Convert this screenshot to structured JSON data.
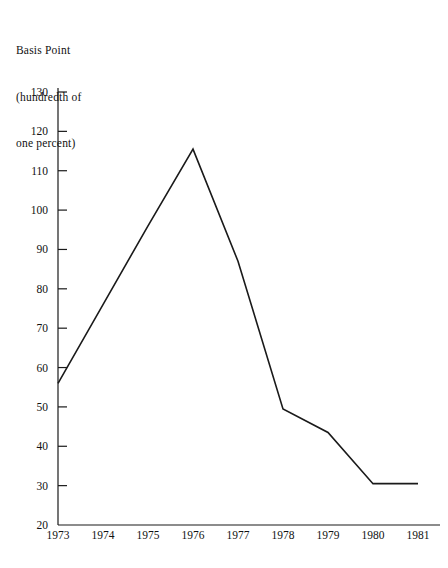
{
  "chart_data": {
    "type": "line",
    "title": "",
    "axis_title_lines": [
      "Basis Point",
      "(hundredth of",
      "one percent)"
    ],
    "ylabel": "Basis Point (hundredth of one percent)",
    "xlabel": "",
    "x": [
      "1973",
      "1974",
      "1975",
      "1976",
      "1977",
      "1978",
      "1979",
      "1980",
      "1981"
    ],
    "categories": [
      "1973",
      "1974",
      "1975",
      "1976",
      "1977",
      "1978",
      "1979",
      "1980",
      "1981"
    ],
    "values": [
      56,
      76,
      96,
      115.5,
      87,
      49.5,
      43.5,
      30.5,
      30.5
    ],
    "series": [
      {
        "name": "Basis Point",
        "values": [
          56,
          76,
          96,
          115.5,
          87,
          49.5,
          43.5,
          30.5,
          30.5
        ]
      }
    ],
    "ylim": [
      20,
      130
    ],
    "xlim": [
      "1973",
      "1981"
    ],
    "ytick_labels": [
      "130",
      "120",
      "110",
      "100",
      "90",
      "80",
      "70",
      "60",
      "50",
      "40",
      "30",
      "20"
    ],
    "ytick_values": [
      130,
      120,
      110,
      100,
      90,
      80,
      70,
      60,
      50,
      40,
      30,
      20
    ],
    "xtick_labels": [
      "1973",
      "1974",
      "1975",
      "1976",
      "1977",
      "1978",
      "1979",
      "1980",
      "1981"
    ],
    "grid": false,
    "legend": false,
    "legend_position": "none",
    "line_color": "#1a1a1a",
    "axis_color": "#1a1a1a",
    "background_color": "#ffffff"
  }
}
